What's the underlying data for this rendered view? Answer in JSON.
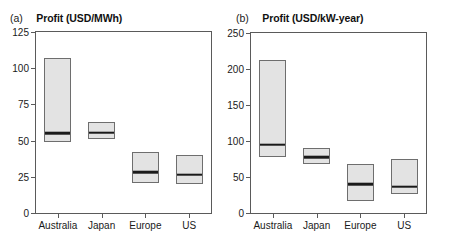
{
  "figure": {
    "width": 455,
    "height": 241,
    "background": "#ffffff",
    "box_fill": "#e3e3e3",
    "box_edge": "#6e6e6e",
    "median_color": "#1a1a1a",
    "axis_color": "#5a5a5a"
  },
  "panels": [
    {
      "letter": "(a)",
      "title": "Profit (USD/MWh)"
    },
    {
      "letter": "(b)",
      "title": "Profit (USD/kW-year)"
    }
  ],
  "chart_data": [
    {
      "type": "bar",
      "title": "Profit (USD/MWh)",
      "panel_label": "(a)",
      "xlabel": "",
      "ylabel": "Profit (USD/MWh)",
      "ylim": [
        0,
        125
      ],
      "yticks": [
        0,
        25,
        50,
        75,
        100,
        125
      ],
      "ytick_labels": [
        "0",
        "25",
        "50",
        "75",
        "100",
        "125"
      ],
      "grid": false,
      "legend": "none",
      "categories": [
        "Australia",
        "Japan",
        "Europe",
        "US"
      ],
      "boxes": [
        {
          "category": "Australia",
          "low": 49,
          "median": 56,
          "high": 107
        },
        {
          "category": "Japan",
          "low": 51,
          "median": 56,
          "high": 63
        },
        {
          "category": "Europe",
          "low": 21,
          "median": 29,
          "high": 42
        },
        {
          "category": "US",
          "low": 20,
          "median": 27,
          "high": 40
        }
      ]
    },
    {
      "type": "bar",
      "title": "Profit (USD/kW-year)",
      "panel_label": "(b)",
      "xlabel": "",
      "ylabel": "Profit (USD/kW-year)",
      "ylim": [
        0,
        250
      ],
      "yticks": [
        0,
        50,
        100,
        150,
        200,
        250
      ],
      "ytick_labels": [
        "0",
        "50",
        "100",
        "150",
        "200",
        "250"
      ],
      "grid": false,
      "legend": "none",
      "categories": [
        "Australia",
        "Japan",
        "Europe",
        "US"
      ],
      "boxes": [
        {
          "category": "Australia",
          "low": 78,
          "median": 96,
          "high": 213
        },
        {
          "category": "Japan",
          "low": 68,
          "median": 79,
          "high": 90
        },
        {
          "category": "Europe",
          "low": 16,
          "median": 41,
          "high": 68
        },
        {
          "category": "US",
          "low": 26,
          "median": 38,
          "high": 75
        }
      ]
    }
  ]
}
